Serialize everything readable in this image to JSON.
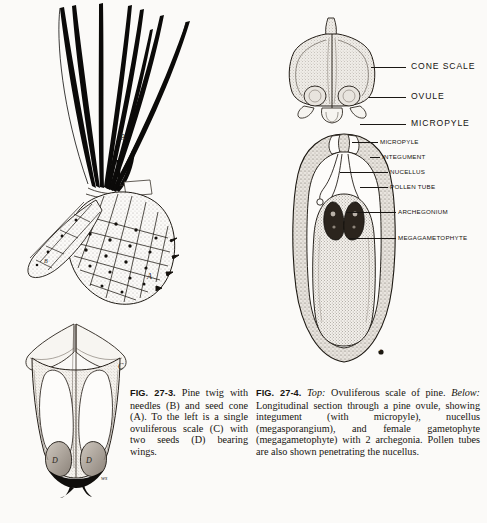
{
  "page": {
    "background_color": "#fbfaf8",
    "ink_color": "#17140f"
  },
  "figures": [
    {
      "id": "fig-27-3",
      "number": "FIG. 27-3.",
      "caption_text": " Pine twig with needles (B) and seed cone (A). To the left is a single ovuliferous scale (C) with two seeds (D) bearing wings.",
      "key_letters": [
        {
          "letter": "A",
          "meaning": "seed cone"
        },
        {
          "letter": "B",
          "meaning": "needles"
        },
        {
          "letter": "C",
          "meaning": "ovuliferous scale"
        },
        {
          "letter": "D",
          "meaning": "seed"
        },
        {
          "letter": "ws",
          "meaning": "wing scar"
        }
      ]
    },
    {
      "id": "fig-27-4",
      "number": "FIG. 27-4.",
      "lead_top": "Top:",
      "lead_below": "Below:",
      "caption_part1": " Ovuliferous scale of pine. ",
      "caption_part2": " Longitudinal section through a pine ovule, showing integument (with micropyle), nucellus (megasporangium), and female gametophyte (megagametophyte) with 2 archegonia. Pollen tubes are also shown penetrating the nucellus.",
      "key_letters": [
        {
          "letter": "G",
          "meaning": "megagametophyte marker"
        }
      ]
    }
  ],
  "labels": {
    "scale_diagram": [
      {
        "id": "cone-scale",
        "text": "CONE SCALE"
      },
      {
        "id": "ovule",
        "text": "OVULE"
      },
      {
        "id": "micropyle-top",
        "text": "MICROPYLE"
      }
    ],
    "ovule_section": [
      {
        "id": "micropyle",
        "text": "MICROPYLE"
      },
      {
        "id": "integument",
        "text": "INTEGUMENT"
      },
      {
        "id": "nucellus",
        "text": "NUCELLUS"
      },
      {
        "id": "pollen-tube",
        "text": "POLLEN TUBE"
      },
      {
        "id": "archegonium",
        "text": "ARCHEGONIUM"
      },
      {
        "id": "megagametophyte",
        "text": "MEGAGAMETOPHYTE"
      }
    ]
  }
}
